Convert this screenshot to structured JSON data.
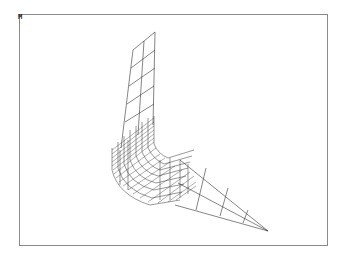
{
  "viewport": {
    "marker_label": "M",
    "frame_color": "#8a8a8a",
    "line_color": "#333333"
  },
  "mesh": {
    "description": "3D wireframe finite-element mesh of an L-shaped bent strip with a tapering tail",
    "vertical_strip": {
      "top_left": [
        133,
        50
      ],
      "top_right": [
        155,
        32
      ],
      "bottom_left": [
        120,
        140
      ],
      "bottom_right": [
        150,
        118
      ],
      "rows": 5,
      "cols": 2
    },
    "tail": {
      "apex": [
        268,
        230
      ],
      "base_top": [
        195,
        170
      ],
      "base_bottom": [
        170,
        200
      ],
      "segments": 4
    }
  }
}
